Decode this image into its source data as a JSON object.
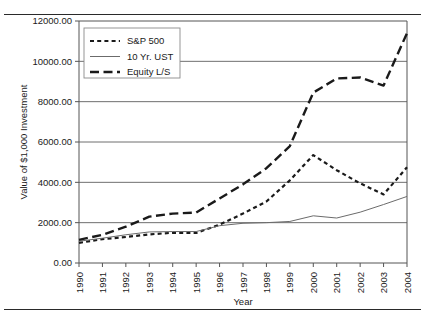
{
  "figure": {
    "top_rule": true,
    "bottom_rule": true
  },
  "chart_data": {
    "type": "line",
    "title": "",
    "xlabel": "Year",
    "ylabel": "Value of $1,000 Investment",
    "x": [
      1990,
      1991,
      1992,
      1993,
      1994,
      1995,
      1996,
      1997,
      1998,
      1999,
      2000,
      2001,
      2002,
      2003,
      2004
    ],
    "categories": [
      "1990",
      "1991",
      "1992",
      "1993",
      "1994",
      "1995",
      "1996",
      "1997",
      "1998",
      "1999",
      "2000",
      "2001",
      "2002",
      "2003",
      "2004"
    ],
    "xlim": [
      1990,
      2004
    ],
    "ylim": [
      0,
      12000
    ],
    "ytick_values": [
      0,
      2000,
      4000,
      6000,
      8000,
      10000,
      12000
    ],
    "ytick_labels": [
      "0.00",
      "2000.00",
      "4000.00",
      "6000.00",
      "8000.00",
      "10000.00",
      "12000.00"
    ],
    "grid": "horizontal",
    "legend_position": "upper-left",
    "series": [
      {
        "name": "S&P 500",
        "style": "short-dash",
        "color": "#1a1a1a",
        "width": 2.2,
        "values": [
          1000,
          1180,
          1290,
          1420,
          1500,
          1490,
          1900,
          2450,
          3050,
          4100,
          5350,
          4600,
          3950,
          3400,
          4750
        ],
        "values_by_year": {
          "1990": 1000,
          "1991": 1180,
          "1992": 1290,
          "1993": 1420,
          "1994": 1500,
          "1995": 1490,
          "1996": 1900,
          "1997": 2450,
          "1998": 3050,
          "1999": 4100,
          "2000": 5350,
          "2001": 4600,
          "2002": 3950,
          "2003": 3400,
          "2004": 4750
        }
      },
      {
        "name": "10 Yr. UST",
        "style": "solid",
        "color": "#6b6b6b",
        "width": 1.0,
        "values": [
          1080,
          1230,
          1400,
          1540,
          1560,
          1560,
          1850,
          1970,
          2000,
          2060,
          2340,
          2230,
          2520,
          2900,
          3300
        ],
        "values_by_year": {
          "1990": 1080,
          "1991": 1230,
          "1992": 1400,
          "1993": 1540,
          "1994": 1560,
          "1995": 1560,
          "1996": 1850,
          "1997": 1970,
          "1998": 2000,
          "1999": 2060,
          "2000": 2340,
          "2001": 2230,
          "2002": 2520,
          "2003": 2900,
          "2004": 3300
        }
      },
      {
        "name": "Equity L/S",
        "style": "long-dash",
        "color": "#1a1a1a",
        "width": 2.4,
        "values": [
          1150,
          1400,
          1800,
          2300,
          2450,
          2500,
          3200,
          3900,
          4700,
          5800,
          8450,
          9150,
          9200,
          8800,
          11400
        ],
        "values_by_year": {
          "1990": 1150,
          "1991": 1400,
          "1992": 1800,
          "1993": 2300,
          "1994": 2450,
          "1995": 2500,
          "1996": 3200,
          "1997": 3900,
          "1998": 4700,
          "1999": 5800,
          "2000": 8450,
          "2001": 9150,
          "2002": 9200,
          "2003": 8800,
          "2004": 11400
        }
      }
    ],
    "legend": [
      {
        "label": "S&P 500",
        "style": "short-dash"
      },
      {
        "label": "10 Yr. UST",
        "style": "solid"
      },
      {
        "label": "Equity L/S",
        "style": "long-dash"
      }
    ]
  }
}
